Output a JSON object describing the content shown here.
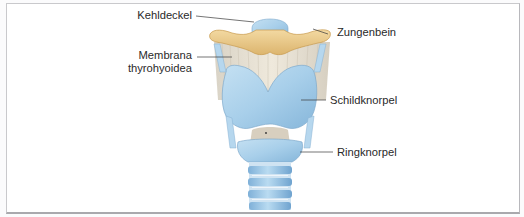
{
  "figure": {
    "labels": {
      "kehldeckel": "Kehldeckel",
      "membrana_line1": "Membrana",
      "membrana_line2": "thyrohyoidea",
      "zungenbein": "Zungenbein",
      "schildknorpel": "Schildknorpel",
      "ringknorpel": "Ringknorpel"
    },
    "colors": {
      "cartilage": "#a9cfe8",
      "cartilage_dark": "#7fb0d6",
      "bone": "#e9c98a",
      "membrane": "#e7e0d2",
      "leader_line": "#3a3a3a",
      "frame_border": "#b5b5b9"
    }
  }
}
